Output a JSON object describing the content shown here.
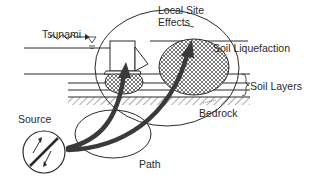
{
  "labels": {
    "tsunami": "Tsunami",
    "local_site_line1": "Local Site",
    "local_site_line2": "Effects",
    "soil_liquefaction": "Soil Liquefaction",
    "soil_layers": "Soil Layers",
    "bedrock": "Bedrock",
    "source": "Source",
    "path": "Path"
  },
  "colors": {
    "line": "#2a2a2a",
    "arrow": "#3a3a3a",
    "hatch": "#555555",
    "background": "#ffffff"
  }
}
